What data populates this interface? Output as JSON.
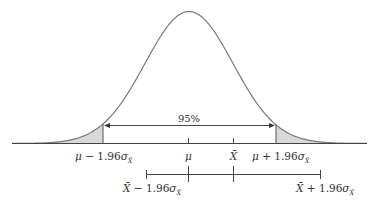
{
  "diagram": {
    "type": "normal-distribution-confidence-interval",
    "center_label": "μ",
    "sample_mean_label": "X̄",
    "area_label": "95%",
    "critical_value": "1.96",
    "sigma_symbol": "σ",
    "sigma_subscript": "X̄",
    "lower_bound": {
      "prefix": "μ − ",
      "value": "1.96",
      "sigma": "σ",
      "sub": "X̄"
    },
    "upper_bound": {
      "prefix": "μ + ",
      "value": "1.96",
      "sigma": "σ",
      "sub": "X̄"
    },
    "interval_lower": {
      "prefix": "X̄ − ",
      "value": "1.96",
      "sigma": "σ",
      "sub": "X̄"
    },
    "interval_upper": {
      "prefix": "X̄ + ",
      "value": "1.96",
      "sigma": "σ",
      "sub": "X̄"
    },
    "colors": {
      "curve": "#7a7a7a",
      "shade": "#d9d9d9",
      "lines": "#444444",
      "text": "#333333"
    }
  }
}
